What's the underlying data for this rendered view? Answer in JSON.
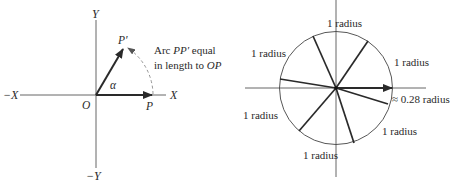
{
  "left_diagram": {
    "axes": {
      "x_pos": "X",
      "x_neg": "−X",
      "y_pos": "Y",
      "y_neg": "−Y",
      "origin": "O"
    },
    "points": {
      "p": "P",
      "p_prime": "P′"
    },
    "angle_label": "α",
    "annotation": {
      "line1_prefix": "Arc ",
      "line1_var": "PP′",
      "line1_suffix": " equal",
      "line2_prefix": "in length to ",
      "line2_var": "OP"
    }
  },
  "right_diagram": {
    "radius_labels": [
      "1 radius",
      "1 radius",
      "1 radius",
      "1 radius",
      "1 radius",
      "1 radius"
    ],
    "remainder_label": "≈ 0.28 radius"
  },
  "colors": {
    "ink": "#2a2a2a",
    "axis": "#555555",
    "arc_dashed": "#888888"
  }
}
